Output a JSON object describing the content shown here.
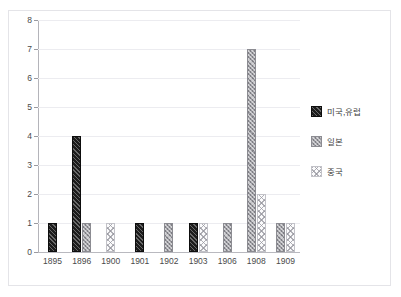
{
  "chart_data": {
    "type": "bar",
    "title": "",
    "xlabel": "",
    "ylabel": "",
    "ylim": [
      0,
      8
    ],
    "ytick_step": 1,
    "yticks": [
      8,
      7,
      6,
      5,
      4,
      3,
      2,
      1,
      0
    ],
    "grid": true,
    "legend_position": "right",
    "categories": [
      "1895",
      "1896",
      "1900",
      "1901",
      "1902",
      "1903",
      "1906",
      "1908",
      "1909"
    ],
    "series": [
      {
        "name": "미국,유럽",
        "key": "us",
        "color": "#1c1c1c",
        "pattern": "diagonal-hatch",
        "values": [
          1,
          4,
          0,
          1,
          0,
          1,
          0,
          0,
          0
        ]
      },
      {
        "name": "일본",
        "key": "jp",
        "color": "#9d9da3",
        "pattern": "checker",
        "values": [
          0,
          1,
          0,
          0,
          1,
          0,
          1,
          7,
          1
        ]
      },
      {
        "name": "중국",
        "key": "cn",
        "color": "#fbfbfc",
        "pattern": "diamond-hatch",
        "values": [
          0,
          0,
          1,
          0,
          0,
          1,
          0,
          2,
          1
        ]
      }
    ]
  },
  "legend": {
    "items": [
      {
        "label": "미국,유럽",
        "swatch": "legend-swatch-us"
      },
      {
        "label": "일본",
        "swatch": "legend-swatch-jp"
      },
      {
        "label": "중국",
        "swatch": "legend-swatch-cn"
      }
    ]
  },
  "colors": {
    "us_series": "#1c1c1c",
    "jp_series": "#9d9da3",
    "cn_series": "#fbfbfc",
    "gridline": "#ececf0",
    "axis": "#b4b4ba",
    "panel_border": "#e4e4e8",
    "background": "#ffffff"
  }
}
